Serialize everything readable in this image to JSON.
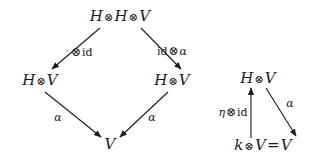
{
  "figure": {
    "kind": "commutative-diagram",
    "background": "#ffffff",
    "ink": "#1a1a1a",
    "diagrams": [
      {
        "id": "associativity-diagram",
        "name": "module-associativity-square",
        "nodes": [
          {
            "id": "top",
            "label": "H ⊗ H ⊗ V",
            "x": 120,
            "y": 16
          },
          {
            "id": "middle-left",
            "label": "H ⊗ V",
            "x": 40,
            "y": 80
          },
          {
            "id": "middle-right",
            "label": "H ⊗ V",
            "x": 172,
            "y": 80
          },
          {
            "id": "bottom",
            "label": "V",
            "x": 110,
            "y": 144
          }
        ],
        "edges": [
          {
            "id": "top-to-left",
            "label": "· ⊗ id",
            "from": "top",
            "to": "middle-left",
            "lx": 79,
            "ly": 52
          },
          {
            "id": "top-to-right",
            "label": "id ⊗ α",
            "from": "top",
            "to": "middle-right",
            "lx": 172,
            "ly": 51
          },
          {
            "id": "left-to-bottom",
            "label": "α",
            "from": "middle-left",
            "to": "bottom",
            "lx": 58,
            "ly": 117
          },
          {
            "id": "right-to-bottom",
            "label": "α",
            "from": "middle-right",
            "to": "bottom",
            "lx": 152,
            "ly": 117
          }
        ]
      },
      {
        "id": "unit-diagram",
        "name": "module-unit-triangle",
        "nodes": [
          {
            "id": "apex",
            "label": "H ⊗ V",
            "x": 258,
            "y": 78
          },
          {
            "id": "base",
            "label": "k ⊗ V = V",
            "x": 263,
            "y": 145
          }
        ],
        "edges": [
          {
            "id": "base-to-apex",
            "label": "η ⊗ id",
            "from": "base",
            "to": "apex",
            "lx": 233,
            "ly": 112
          },
          {
            "id": "apex-to-base",
            "label": "α",
            "from": "apex",
            "to": "base",
            "lx": 290,
            "ly": 103
          }
        ]
      }
    ]
  }
}
